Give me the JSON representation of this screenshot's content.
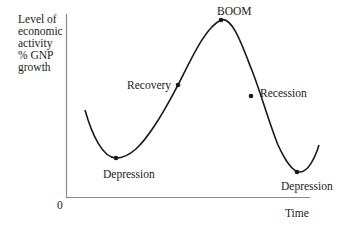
{
  "diagram": {
    "y_axis_label_lines": [
      "Level of",
      "economic",
      "activity",
      "% GNP",
      "growth"
    ],
    "x_axis_label": "Time",
    "origin_label": "0",
    "points": {
      "depression_1": "Depression",
      "recovery": "Recovery",
      "boom": "BOOM",
      "recession": "Recession",
      "depression_2": "Depression"
    },
    "colors": {
      "curve": "#1a1a1a",
      "axis": "#888888",
      "text": "#1a1a1a"
    }
  }
}
